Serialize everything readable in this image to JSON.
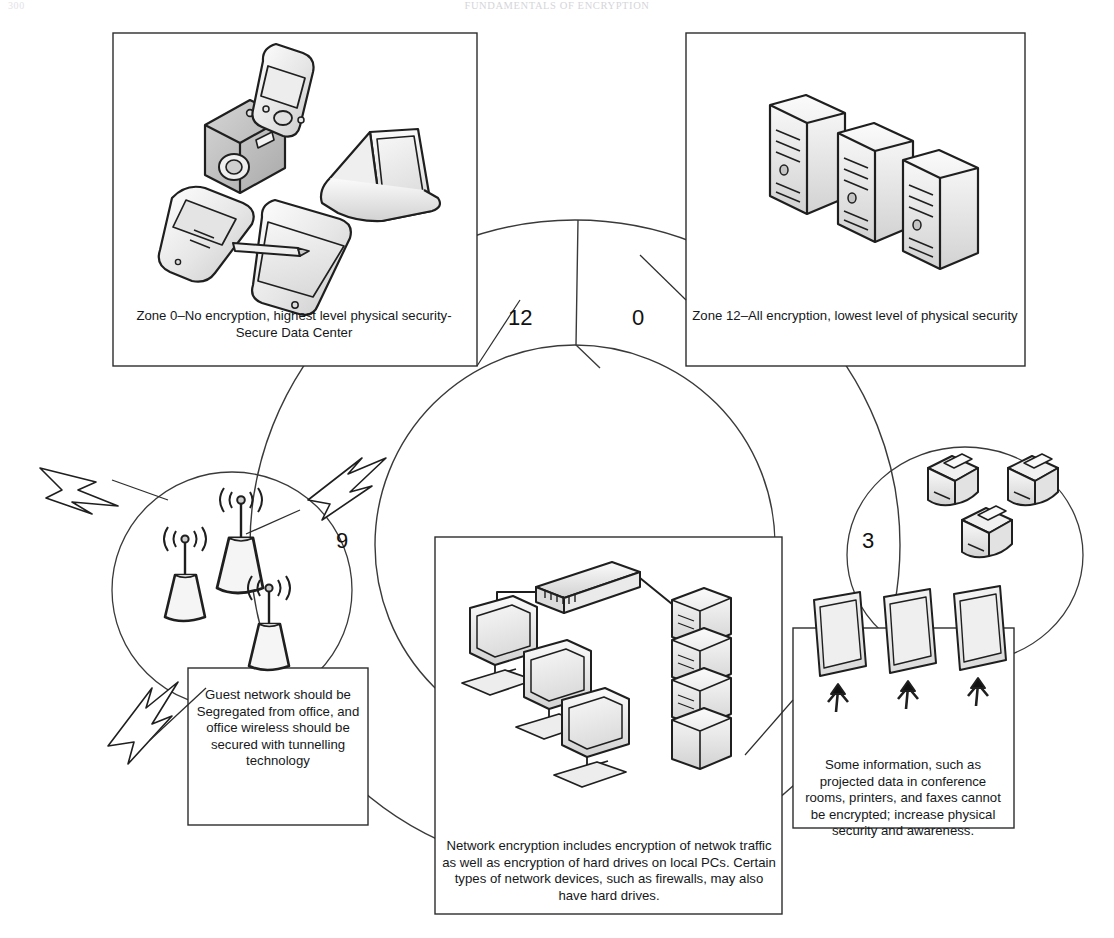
{
  "page": {
    "folio": "300",
    "running_head": "Fundamentals of Encryption"
  },
  "figure": {
    "zone_numbers": {
      "top_left": "12",
      "top_right": "0",
      "left": "9",
      "right": "3"
    },
    "captions": {
      "zone0": "Zone 0–No encryption, highest level physical security-Secure Data Center",
      "zone12": "Zone 12–All encryption, lowest level of physical security",
      "wireless": "Guest network should be Segregated from office, and office wireless should be secured with tunnelling technology",
      "network": "Network encryption includes encryption of netwok traffic as well as encryption of hard drives on local PCs. Certain types of network devices, such as firewalls, may also have hard drives.",
      "physical": "Some information, such as projected data in conference rooms, printers, and faxes cannot be encrypted; increase physical security and awareness."
    },
    "illustrations": {
      "mobile_devices": "digital-camera, pda-handheld, flip-phone, tablet-with-stylus, laptop",
      "servers": "three-server-towers",
      "wireless": "three-wireless-access-points-with-signal-arcs-and-lightning-bolts",
      "network": "three-desktop-pcs, network-switch, server-rack-stack",
      "peripherals": "three-printers-faxes",
      "displays": "three-projector-screens-with-arrows"
    },
    "colors": {
      "ink": "#111111",
      "line": "#2a2a2a",
      "fill_light": "#f2f2f2",
      "fill_mid": "#d9d9d9",
      "fill_dark": "#b4b4b4"
    }
  }
}
